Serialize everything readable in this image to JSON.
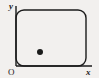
{
  "figure": {
    "type": "coordinate-diagram",
    "background_color": "#f2f0ee",
    "ink_color": "#1b1b1b",
    "width": 99,
    "height": 78
  },
  "labels": {
    "y_axis": "y",
    "x_axis": "x",
    "origin": "O"
  },
  "axes": {
    "y_axis": {
      "x": 16,
      "y_top": 6,
      "y_bottom": 66
    },
    "x_axis": {
      "y": 66,
      "x_left": 16,
      "x_right": 92
    }
  },
  "region": {
    "name": "rounded-rectangle-region",
    "left": 16,
    "top": 10,
    "right": 86,
    "bottom": 66,
    "corner_radius": 8,
    "stroke_color": "#1b1b1b",
    "stroke_width": 1.4,
    "fill": "none"
  },
  "point": {
    "name": "interior-point",
    "cx": 40,
    "cy": 52,
    "r": 3,
    "fill": "#1b1b1b"
  },
  "label_positions": {
    "y": {
      "x": 9,
      "y": 9
    },
    "o": {
      "x": 8,
      "y": 75
    },
    "x": {
      "x": 86,
      "y": 75
    }
  }
}
